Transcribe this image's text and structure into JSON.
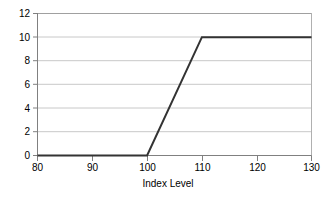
{
  "chart_data": {
    "type": "line",
    "title": "",
    "subtitle": "",
    "xlabel": "Index Level",
    "ylabel": "",
    "xlim": [
      80,
      130
    ],
    "ylim": [
      0,
      12
    ],
    "xticks": [
      80,
      90,
      100,
      110,
      120,
      130
    ],
    "yticks": [
      0,
      2,
      4,
      6,
      8,
      10,
      12
    ],
    "xtick_labels": [
      "80",
      "90",
      "100",
      "110",
      "120",
      "130"
    ],
    "ytick_labels": [
      "0",
      "2",
      "4",
      "6",
      "8",
      "10",
      "12"
    ],
    "grid": "horizontal",
    "legend": "none",
    "series": [
      {
        "name": "Payoff",
        "x": [
          80,
          100,
          110,
          130
        ],
        "values": [
          0,
          0,
          10,
          10
        ],
        "color": "#333333"
      }
    ],
    "annotations": []
  },
  "style": {
    "line_color": "#333333",
    "grid_color": "#c8c8c8",
    "axis_color": "#808080",
    "text_color": "#000000",
    "background": "#ffffff"
  }
}
